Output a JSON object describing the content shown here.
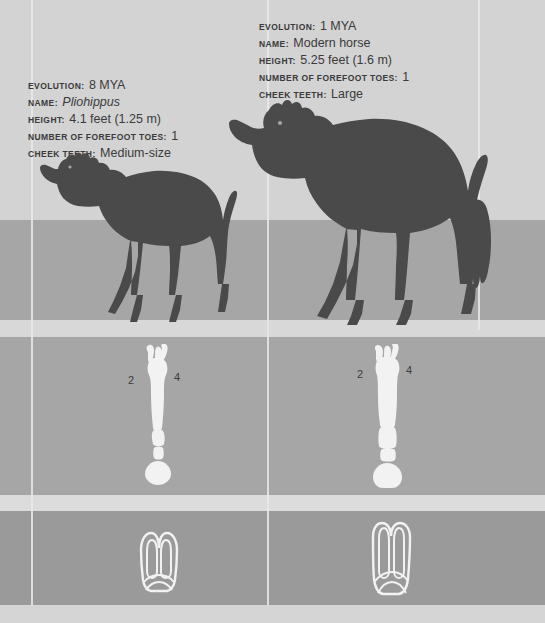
{
  "figure": {
    "colors": {
      "band_top": "#d3d3d3",
      "band_middle": "#a6a6a6",
      "band_teeth": "#9a9a9a",
      "divider": "#e9e9e9",
      "silhouette": "#4a4a4a",
      "bone": "#f2f2f2",
      "text": "#3a3a3a"
    }
  },
  "labels": {
    "evolution": "EVOLUTION:",
    "name": "NAME:",
    "height": "HEIGHT:",
    "forefoot_toes": "NUMBER OF FOREFOOT TOES:",
    "cheek_teeth": "CHEEK TEETH:"
  },
  "specimens": [
    {
      "id": "pliohippus",
      "evolution": "8 MYA",
      "name": "Pliohippus",
      "height": "4.1 feet (1.25 m)",
      "forefoot_toes": "1",
      "cheek_teeth": "Medium-size",
      "digits": {
        "left": "2",
        "right": "4",
        "center": "3"
      }
    },
    {
      "id": "modern-horse",
      "evolution": "1 MYA",
      "name": "Modern horse",
      "height": "5.25 feet (1.6 m)",
      "forefoot_toes": "1",
      "cheek_teeth": "Large",
      "digits": {
        "left": "2",
        "right": "4",
        "center": "3"
      }
    }
  ]
}
